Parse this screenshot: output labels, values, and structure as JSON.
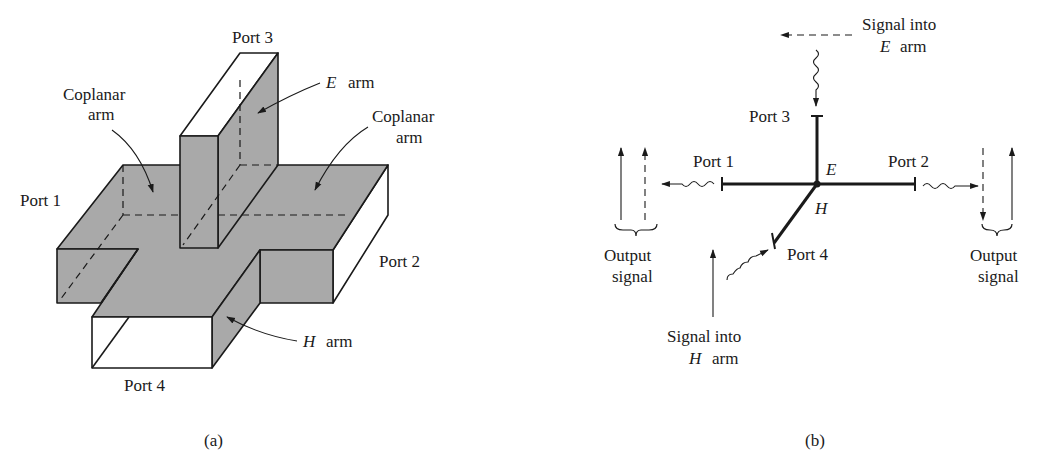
{
  "figure_a": {
    "caption": "(a)",
    "labels": {
      "port1": "Port 1",
      "port2": "Port 2",
      "port3": "Port 3",
      "port4": "Port 4",
      "coplanar_left_1": "Coplanar",
      "coplanar_left_2": "arm",
      "coplanar_right_1": "Coplanar",
      "coplanar_right_2": "arm",
      "e_arm_var": "E",
      "e_arm_word": "arm",
      "h_arm_var": "H",
      "h_arm_word": "arm"
    },
    "colors": {
      "fill": "#a9a9a9",
      "stroke": "#1a1a1a"
    }
  },
  "figure_b": {
    "caption": "(b)",
    "labels": {
      "port1": "Port 1",
      "port2": "Port 2",
      "port3": "Port 3",
      "port4": "Port 4",
      "junction_e": "E",
      "junction_h": "H",
      "signal_e_1": "Signal into",
      "signal_e_var": "E",
      "signal_e_word": "arm",
      "signal_h_1": "Signal into",
      "signal_h_var": "H",
      "signal_h_word": "arm",
      "output_left_1": "Output",
      "output_left_2": "signal",
      "output_right_1": "Output",
      "output_right_2": "signal"
    }
  }
}
